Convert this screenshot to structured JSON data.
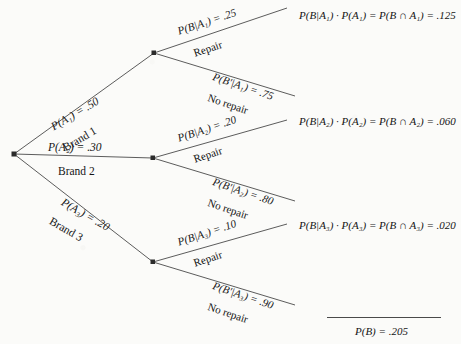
{
  "diagram": {
    "type": "probability-tree",
    "title": "",
    "root_label": ""
  },
  "branches": [
    {
      "id": "brand1",
      "prob_label": "P(A₁) = .50",
      "prob_value": 0.5,
      "name_label": "Brand 1",
      "cond_repair_label": "P(B|A₁) = .25",
      "cond_repair_value": 0.25,
      "repair_label": "Repair",
      "cond_norepair_label": "P(Bʹ|A₁) = .75",
      "cond_norepair_value": 0.75,
      "norepair_label": "No repair",
      "outcome_label": "P(B|A₁) · P(A₁) = P(B ∩ A₁) = .125",
      "outcome_value": 0.125
    },
    {
      "id": "brand2",
      "prob_label": "P(A₂) = .30",
      "prob_value": 0.3,
      "name_label": "Brand 2",
      "cond_repair_label": "P(B|A₂) = .20",
      "cond_repair_value": 0.2,
      "repair_label": "Repair",
      "cond_norepair_label": "P(Bʹ|A₂) = .80",
      "cond_norepair_value": 0.8,
      "norepair_label": "No repair",
      "outcome_label": "P(B|A₂) · P(A₂) = P(B ∩ A₂) = .060",
      "outcome_value": 0.06
    },
    {
      "id": "brand3",
      "prob_label": "P(A₃) = .20",
      "prob_value": 0.2,
      "name_label": "Brand 3",
      "cond_repair_label": "P(B|A₃) = .10",
      "cond_repair_value": 0.1,
      "repair_label": "Repair",
      "cond_norepair_label": "P(Bʹ|A₃) = .90",
      "cond_norepair_value": 0.9,
      "norepair_label": "No repair",
      "outcome_label": "P(B|A₃) · P(A₃) = P(B ∩ A₃) = .020",
      "outcome_value": 0.02
    }
  ],
  "total": {
    "label": "P(B) = .205",
    "value": 0.205
  },
  "colors": {
    "line": "#4a4a4a",
    "node": "#2b2b2b",
    "text": "#151515",
    "background": "#fbfbf9"
  }
}
